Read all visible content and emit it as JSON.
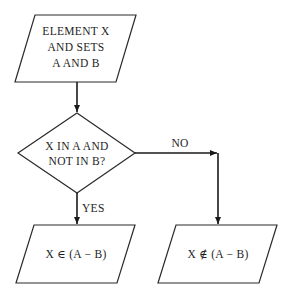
{
  "diagram": {
    "type": "flowchart",
    "nodes": {
      "input": {
        "shape": "parallelogram",
        "lines": [
          "ELEMENT X",
          "AND SETS",
          "A AND B"
        ]
      },
      "decision": {
        "shape": "diamond",
        "lines": [
          "X IN A AND",
          "NOT IN B?"
        ]
      },
      "yes_output": {
        "shape": "parallelogram",
        "text": "X ∈ (A − B)"
      },
      "no_output": {
        "shape": "parallelogram",
        "text": "X ∉ (A − B)"
      }
    },
    "edges": {
      "yes_label": "YES",
      "no_label": "NO"
    }
  }
}
